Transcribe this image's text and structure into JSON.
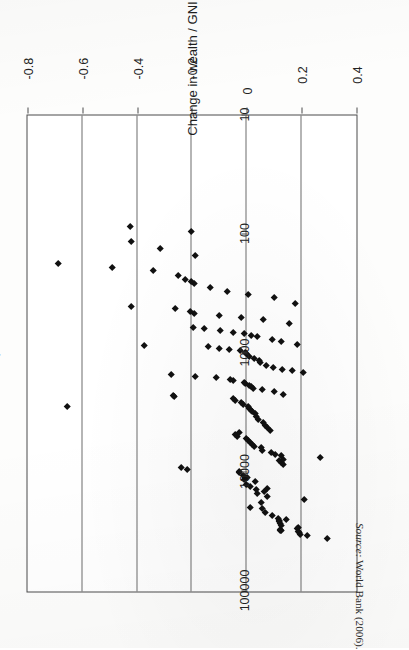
{
  "figure": {
    "rotation_degrees": 90,
    "value_axis": {
      "title": "Change in wealth / GNI",
      "ticks": [
        "0.4",
        "0.2",
        "0",
        "-0.2",
        "-0.4",
        "-0.6",
        "-0.8"
      ],
      "tick_values": [
        0.4,
        0.2,
        0,
        -0.2,
        -0.4,
        -0.6,
        -0.8
      ],
      "min": -0.8,
      "max": 0.4
    },
    "log_axis": {
      "title": "GNI / capita, $",
      "ticks": [
        "10",
        "100",
        "1000",
        "10000",
        "100000"
      ],
      "tick_values": [
        10,
        100,
        1000,
        10000,
        100000
      ],
      "min": 10,
      "max": 100000,
      "scale": "log"
    },
    "colors": {
      "marker": "#111111",
      "frame": "#4a4a4a",
      "gridline": "#6d6d6d",
      "background": "#ffffff",
      "text": "#232323"
    }
  },
  "source": {
    "label": "Source:",
    "text": "World Bank (2006)."
  },
  "chart_data": {
    "type": "scatter",
    "title": "",
    "subtitle": "",
    "xlabel": "GNI / capita, $",
    "ylabel": "Change in wealth / GNI",
    "xscale": "log",
    "yscale": "linear",
    "xlim": [
      10,
      100000
    ],
    "ylim": [
      -0.8,
      0.4
    ],
    "xticks": [
      10,
      100,
      1000,
      10000,
      100000
    ],
    "yticks": [
      0.4,
      0.2,
      0,
      -0.2,
      -0.4,
      -0.6,
      -0.8
    ],
    "grid": "x-gridlines-only",
    "legend": "none",
    "marker": "filled-diamond",
    "n_points": 131,
    "points": [
      [
        34000,
        0.22
      ],
      [
        29000,
        0.19
      ],
      [
        29500,
        0.185
      ],
      [
        25000,
        0.145
      ],
      [
        36000,
        0.295
      ],
      [
        31000,
        0.128
      ],
      [
        30500,
        0.124
      ],
      [
        30000,
        0.122
      ],
      [
        28000,
        0.126
      ],
      [
        27000,
        0.121
      ],
      [
        26000,
        0.118
      ],
      [
        25500,
        0.118
      ],
      [
        24500,
        0.114
      ],
      [
        33000,
        0.196
      ],
      [
        32000,
        0.193
      ],
      [
        31500,
        0.19
      ],
      [
        23000,
        0.095
      ],
      [
        21500,
        0.068
      ],
      [
        20000,
        0.058
      ],
      [
        19500,
        0.012
      ],
      [
        18000,
        0.055
      ],
      [
        17000,
        0.212
      ],
      [
        16000,
        0.077
      ],
      [
        15000,
        0.038
      ],
      [
        14500,
        0.065
      ],
      [
        14000,
        0.035
      ],
      [
        13500,
        0.075
      ],
      [
        13000,
        0.012
      ],
      [
        12500,
        -0.003
      ],
      [
        12000,
        0.032
      ],
      [
        11500,
        -0.008
      ],
      [
        11000,
        0.001
      ],
      [
        10500,
        -0.012
      ],
      [
        10000,
        -0.025
      ],
      [
        9800,
        -0.028
      ],
      [
        9500,
        -0.215
      ],
      [
        9000,
        -0.238
      ],
      [
        8600,
        0.133
      ],
      [
        8300,
        0.125
      ],
      [
        8000,
        0.118
      ],
      [
        7800,
        0.132
      ],
      [
        7500,
        0.27
      ],
      [
        7200,
        0.128
      ],
      [
        7000,
        0.106
      ],
      [
        6800,
        0.09
      ],
      [
        6500,
        0.058
      ],
      [
        6200,
        0.052
      ],
      [
        6000,
        0.028
      ],
      [
        5800,
        0.02
      ],
      [
        5600,
        0.012
      ],
      [
        5400,
        0.007
      ],
      [
        5200,
        -0.002
      ],
      [
        5000,
        -0.033
      ],
      [
        4800,
        -0.04
      ],
      [
        4600,
        -0.028
      ],
      [
        4400,
        0.086
      ],
      [
        4200,
        0.074
      ],
      [
        4000,
        0.068
      ],
      [
        3800,
        0.062
      ],
      [
        3600,
        0.041
      ],
      [
        3400,
        0.036
      ],
      [
        3200,
        0.03
      ],
      [
        3100,
        0.022
      ],
      [
        3000,
        0.018
      ],
      [
        2900,
        0.01
      ],
      [
        2800,
        0.006
      ],
      [
        2700,
        -0.012
      ],
      [
        2600,
        -0.02
      ],
      [
        2500,
        -0.04
      ],
      [
        2400,
        -0.05
      ],
      [
        2300,
        -0.263
      ],
      [
        2250,
        -0.268
      ],
      [
        2200,
        0.133
      ],
      [
        2100,
        0.101
      ],
      [
        2000,
        0.056
      ],
      [
        1950,
        0.024
      ],
      [
        1900,
        0.018
      ],
      [
        1850,
        0.009
      ],
      [
        1800,
        -0.004
      ],
      [
        1750,
        -0.01
      ],
      [
        1700,
        -0.048
      ],
      [
        1650,
        -0.06
      ],
      [
        1600,
        -0.11
      ],
      [
        1550,
        -0.188
      ],
      [
        1500,
        -0.273
      ],
      [
        1450,
        0.207
      ],
      [
        1400,
        0.165
      ],
      [
        1350,
        0.129
      ],
      [
        1300,
        0.096
      ],
      [
        1250,
        0.07
      ],
      [
        1200,
        0.051
      ],
      [
        1150,
        0.047
      ],
      [
        1100,
        0.028
      ],
      [
        1050,
        0.008
      ],
      [
        1000,
        -0.003
      ],
      [
        980,
        -0.006
      ],
      [
        950,
        -0.022
      ],
      [
        920,
        -0.065
      ],
      [
        900,
        -0.1
      ],
      [
        880,
        -0.14
      ],
      [
        860,
        -0.375
      ],
      [
        840,
        0.186
      ],
      [
        800,
        0.125
      ],
      [
        760,
        0.095
      ],
      [
        720,
        0.04
      ],
      [
        700,
        0.017
      ],
      [
        680,
        -0.008
      ],
      [
        660,
        -0.05
      ],
      [
        640,
        -0.095
      ],
      [
        620,
        -0.155
      ],
      [
        600,
        -0.195
      ],
      [
        560,
        0.155
      ],
      [
        520,
        0.06
      ],
      [
        500,
        -0.02
      ],
      [
        480,
        -0.1
      ],
      [
        460,
        -0.19
      ],
      [
        440,
        -0.205
      ],
      [
        420,
        -0.262
      ],
      [
        400,
        -0.42
      ],
      [
        380,
        0.178
      ],
      [
        340,
        0.1
      ],
      [
        320,
        0.006
      ],
      [
        300,
        -0.072
      ],
      [
        280,
        -0.133
      ],
      [
        260,
        -0.192
      ],
      [
        250,
        -0.2
      ],
      [
        240,
        -0.225
      ],
      [
        220,
        -0.25
      ],
      [
        200,
        -0.34
      ],
      [
        190,
        -0.49
      ],
      [
        175,
        -0.688
      ],
      [
        150,
        -0.186
      ],
      [
        130,
        -0.315
      ],
      [
        115,
        -0.42
      ],
      [
        95,
        -0.2
      ],
      [
        85,
        -0.425
      ],
      [
        2800,
        -0.655
      ]
    ]
  }
}
